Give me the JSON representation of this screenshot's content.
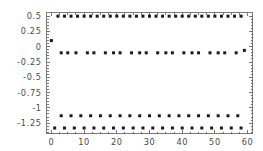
{
  "chart_data": {
    "type": "scatter",
    "title": "",
    "subtitle": "",
    "xlabel": "",
    "ylabel": "",
    "xlim": [
      -1.5,
      61.5
    ],
    "ylim": [
      -1.42,
      0.56
    ],
    "grid": false,
    "legend": null,
    "legend_position": "none",
    "frame": true,
    "xticks": [
      0,
      10,
      20,
      30,
      40,
      50,
      60
    ],
    "xtick_labels": [
      "0",
      "10",
      "20",
      "30",
      "40",
      "50",
      "60"
    ],
    "xminor_ticks": [
      2.5,
      5,
      7.5,
      12.5,
      15,
      17.5,
      22.5,
      25,
      27.5,
      32.5,
      35,
      37.5,
      42.5,
      45,
      47.5,
      52.5,
      55,
      57.5
    ],
    "yticks": [
      0.5,
      0.25,
      0,
      -0.25,
      -0.5,
      -0.75,
      -1,
      -1.25
    ],
    "ytick_labels": [
      "0.5",
      "0.25",
      "0",
      "-0.25",
      "-0.5",
      "-0.75",
      "-1",
      "-1.25"
    ],
    "yminor_ticks": [
      0.45,
      0.4,
      0.35,
      0.3,
      0.2,
      0.15,
      0.1,
      0.05,
      -0.05,
      -0.1,
      -0.15,
      -0.2,
      -0.3,
      -0.35,
      -0.4,
      -0.45,
      -0.55,
      -0.6,
      -0.65,
      -0.7,
      -0.8,
      -0.85,
      -0.9,
      -0.95,
      -1.05,
      -1.1,
      -1.15,
      -1.2,
      -1.3,
      -1.35,
      -1.4
    ],
    "marker": "point",
    "marker_size": 1.5,
    "marker_color": "#1a1a1a",
    "series": [
      {
        "name": "band-upper",
        "y_level": 0.5,
        "x": [
          2,
          4,
          6,
          8,
          10,
          12,
          14,
          16,
          18,
          20,
          22,
          24,
          26,
          28,
          30,
          32,
          34,
          36,
          38,
          40,
          42,
          44,
          46,
          48,
          50,
          52,
          54,
          56,
          58
        ],
        "y": [
          0.5,
          0.5,
          0.5,
          0.5,
          0.5,
          0.5,
          0.5,
          0.5,
          0.5,
          0.5,
          0.5,
          0.5,
          0.5,
          0.5,
          0.5,
          0.5,
          0.5,
          0.5,
          0.5,
          0.5,
          0.5,
          0.5,
          0.5,
          0.5,
          0.5,
          0.5,
          0.5,
          0.5,
          0.5
        ]
      },
      {
        "name": "band-middle",
        "y_level": -0.1,
        "x": [
          3,
          5,
          7.5,
          11,
          13,
          16.5,
          19,
          21,
          24.5,
          27,
          29,
          32.5,
          35,
          37,
          40.5,
          43,
          45,
          48.5,
          51,
          53,
          56.5,
          59
        ],
        "y": [
          -0.1,
          -0.1,
          -0.1,
          -0.1,
          -0.1,
          -0.1,
          -0.1,
          -0.1,
          -0.1,
          -0.1,
          -0.1,
          -0.1,
          -0.1,
          -0.1,
          -0.1,
          -0.1,
          -0.1,
          -0.1,
          -0.1,
          -0.1,
          -0.1,
          -0.06
        ]
      },
      {
        "name": "band-lower",
        "y_level": -1.13,
        "x": [
          3,
          6,
          9,
          12,
          15,
          18,
          21,
          24,
          27,
          30,
          33,
          36,
          39,
          42,
          45,
          48,
          51,
          54,
          57
        ],
        "y": [
          -1.13,
          -1.13,
          -1.13,
          -1.13,
          -1.13,
          -1.13,
          -1.13,
          -1.13,
          -1.13,
          -1.13,
          -1.13,
          -1.13,
          -1.13,
          -1.13,
          -1.13,
          -1.13,
          -1.13,
          -1.13,
          -1.13
        ]
      },
      {
        "name": "band-bottom",
        "y_level": -1.33,
        "x": [
          1,
          4,
          7,
          10,
          13,
          16,
          19,
          22,
          25,
          28,
          31,
          34,
          37,
          40,
          43,
          46,
          49,
          52,
          55,
          58
        ],
        "y": [
          -1.33,
          -1.33,
          -1.33,
          -1.33,
          -1.33,
          -1.33,
          -1.33,
          -1.33,
          -1.33,
          -1.33,
          -1.33,
          -1.33,
          -1.33,
          -1.33,
          -1.33,
          -1.33,
          -1.33,
          -1.33,
          -1.33,
          -1.33
        ]
      },
      {
        "name": "origin-outlier",
        "y_level": 0.1,
        "x": [
          0
        ],
        "y": [
          0.1
        ]
      }
    ]
  }
}
